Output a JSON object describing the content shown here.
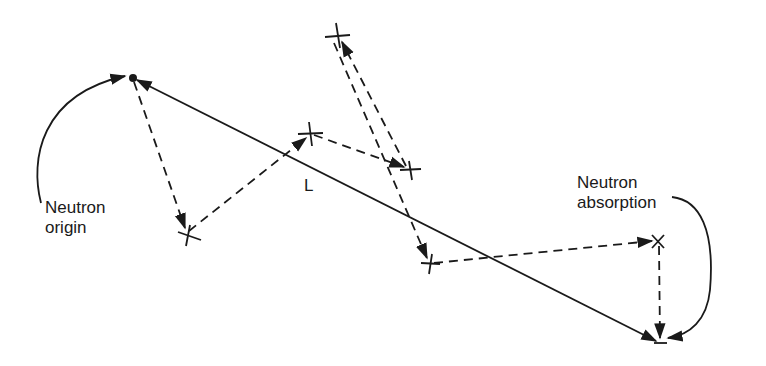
{
  "diagram": {
    "type": "neutron random walk",
    "labels": {
      "origin_line1": "Neutron",
      "origin_line2": "origin",
      "absorption_line1": "Neutron",
      "absorption_line2": "absorption",
      "distance": "L"
    },
    "points": {
      "origin": [
        133,
        78
      ],
      "collisions": [
        [
          187,
          233
        ],
        [
          310,
          134
        ],
        [
          337,
          37
        ],
        [
          410,
          170
        ],
        [
          430,
          263
        ],
        [
          658,
          241
        ]
      ],
      "absorption": [
        660,
        343
      ]
    },
    "colors": {
      "ink": "#1a1a1a",
      "background": "#ffffff"
    }
  }
}
